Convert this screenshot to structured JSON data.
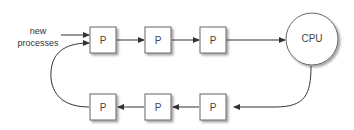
{
  "diagram": {
    "input_label_line1": "new",
    "input_label_line2": "processes",
    "process_label": "P",
    "cpu_label": "CPU",
    "top_row": [
      "P",
      "P",
      "P"
    ],
    "bottom_row": [
      "P",
      "P",
      "P"
    ]
  }
}
